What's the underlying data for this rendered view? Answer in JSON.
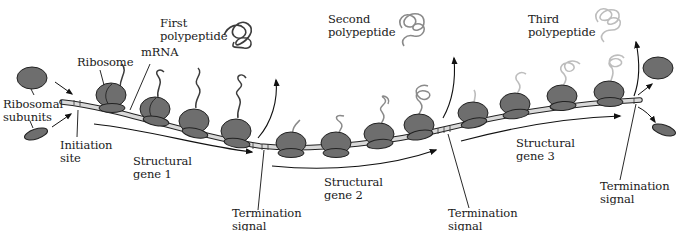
{
  "figure": {
    "title_cut": "",
    "labels": {
      "ribosomal_subunits": "Ribosomal\nsubunits",
      "ribosome": "Ribosome",
      "mrna": "mRNA",
      "initiation_site": "Initiation\nsite",
      "first_polypeptide": "First\npolypeptide",
      "second_polypeptide": "Second\npolypeptide",
      "third_polypeptide": "Third\npolypeptide",
      "structural_gene_1": "Structural\ngene 1",
      "structural_gene_2": "Structural\ngene 2",
      "structural_gene_3": "Structural\ngene 3",
      "termination_signal_1": "Termination\nsignal",
      "termination_signal_2": "Termination\nsignal",
      "termination_signal_3": "Termination\nsignal"
    },
    "colors": {
      "ribosome_fill": "#6e6e6e",
      "ribosome_stroke": "#222222",
      "mrna_fill": "#d9d9d9",
      "polypeptide_gene1": "#3c3c3c",
      "polypeptide_gene2": "#8a8a8a",
      "polypeptide_gene3": "#bdbdbd",
      "line": "#111111"
    }
  }
}
